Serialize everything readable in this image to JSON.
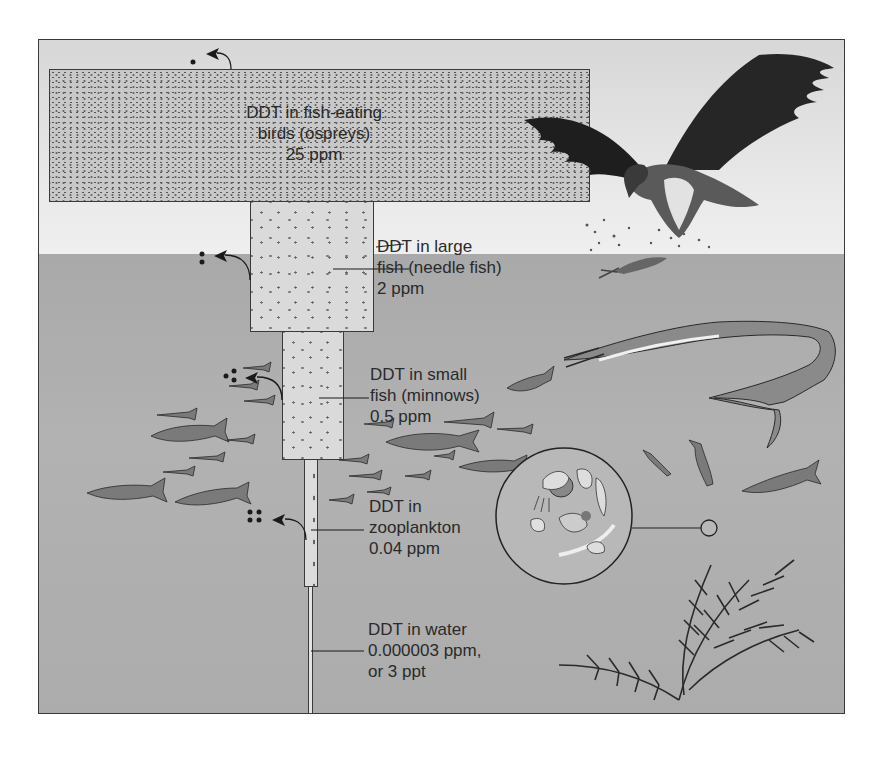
{
  "diagram": {
    "colors": {
      "sky": "#e6e6e6",
      "water": "#acacac",
      "box_fill": "#d0d0d0",
      "outline": "#3a3a3a",
      "text": "#2a2a2a"
    },
    "levels": [
      {
        "name": "fish-eating birds (ospreys)",
        "lines": [
          "DDT in fish-eating",
          "birds (ospreys)",
          "25 ppm"
        ],
        "concentration": "25 ppm",
        "dots_released": 1
      },
      {
        "name": "large fish (needle fish)",
        "lines": [
          "DDT in large",
          "fish (needle fish)",
          "2 ppm"
        ],
        "concentration": "2 ppm",
        "dots_released": 2
      },
      {
        "name": "small fish (minnows)",
        "lines": [
          "DDT in small",
          "fish (minnows)",
          "0.5 ppm"
        ],
        "concentration": "0.5 ppm",
        "dots_released": 3
      },
      {
        "name": "zooplankton",
        "lines": [
          "DDT in",
          "zooplankton",
          "0.04 ppm"
        ],
        "concentration": "0.04 ppm",
        "dots_released": 4
      },
      {
        "name": "water",
        "lines": [
          "DDT in water",
          "0.000003 ppm,",
          "or 3 ppt"
        ],
        "concentration": "0.000003 ppm, or 3 ppt"
      }
    ],
    "illustrations": [
      "osprey-icon",
      "needle-fish-icon",
      "minnow-school-icon",
      "zooplankton-magnified-circle",
      "aquatic-plant-icon"
    ]
  }
}
